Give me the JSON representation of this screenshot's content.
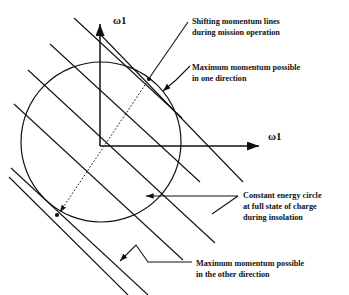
{
  "figure": {
    "background_color": "#ffffff",
    "stroke_color": "#111111"
  },
  "axes": {
    "vertical_label": "ω1",
    "horizontal_label": "ω1",
    "origin": {
      "x": 100,
      "y": 146
    },
    "vertical_tip": {
      "x": 101,
      "y": 20
    },
    "horizontal_tip": {
      "x": 265,
      "y": 147
    }
  },
  "circle": {
    "center_x": 101,
    "center_y": 142,
    "radius": 80,
    "label": "constant-energy-circle"
  },
  "momentum_lines": {
    "count": 5,
    "slope_description": "parallel lines of negative slope",
    "tangent_point_upper": {
      "x": 149,
      "y": 79
    },
    "tangent_point_lower": {
      "x": 57,
      "y": 215
    }
  },
  "annotations": [
    {
      "id": "shifting-momentum-lines",
      "lines": [
        "Shifting momentum lines",
        "during mission operation"
      ],
      "x": 192,
      "y": 16
    },
    {
      "id": "maximum-momentum-one-direction",
      "lines": [
        "Maximum momentum possible",
        "in one direction"
      ],
      "x": 192,
      "y": 62
    },
    {
      "id": "constant-energy-circle",
      "lines": [
        "Constant energy circle",
        "at full state of  charge",
        "during insolation"
      ],
      "x": 243,
      "y": 190
    },
    {
      "id": "maximum-momentum-other-direction",
      "lines": [
        "Maximum momentum possible",
        "in the other direction"
      ],
      "x": 196,
      "y": 258
    }
  ]
}
